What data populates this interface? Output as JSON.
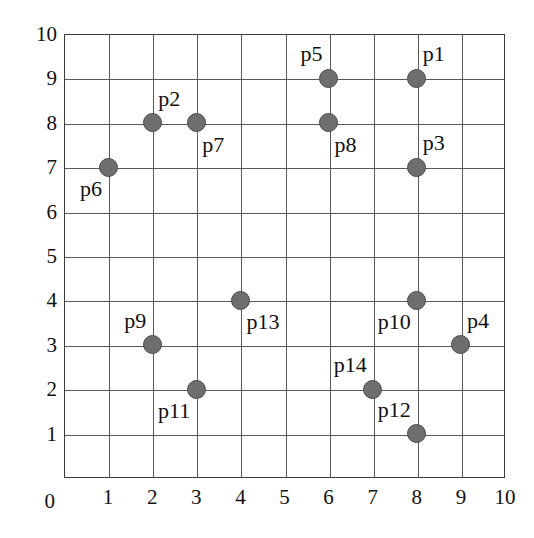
{
  "chart_data": {
    "type": "scatter",
    "title": "",
    "xlabel": "",
    "ylabel": "",
    "xlim": [
      0,
      10
    ],
    "ylim": [
      0,
      10
    ],
    "grid": true,
    "legend": "none",
    "marker": {
      "shape": "circle",
      "fill_color": "#6e6e6e",
      "edge_color": "#4a4a4a",
      "size_px": 19
    },
    "axis": {
      "frame_color": "#3c3c3c",
      "grid_color": "#5a5a5a",
      "x_ticks": [
        0,
        1,
        2,
        3,
        4,
        5,
        6,
        7,
        8,
        9,
        10
      ],
      "y_ticks": [
        0,
        1,
        2,
        3,
        4,
        5,
        6,
        7,
        8,
        9,
        10
      ],
      "x_tick_labels": [
        "0",
        "1",
        "2",
        "3",
        "4",
        "5",
        "6",
        "7",
        "8",
        "9",
        "10"
      ],
      "y_tick_labels": [
        "0",
        "1",
        "2",
        "3",
        "4",
        "5",
        "6",
        "7",
        "8",
        "9",
        "10"
      ]
    },
    "points": [
      {
        "label": "p1",
        "x": 8,
        "y": 9,
        "label_pos": "above-right"
      },
      {
        "label": "p2",
        "x": 2,
        "y": 8,
        "label_pos": "above-right"
      },
      {
        "label": "p3",
        "x": 8,
        "y": 7,
        "label_pos": "above-right"
      },
      {
        "label": "p4",
        "x": 9,
        "y": 3,
        "label_pos": "above-right"
      },
      {
        "label": "p5",
        "x": 6,
        "y": 9,
        "label_pos": "above-left"
      },
      {
        "label": "p6",
        "x": 1,
        "y": 7,
        "label_pos": "below-left"
      },
      {
        "label": "p7",
        "x": 3,
        "y": 8,
        "label_pos": "below-right"
      },
      {
        "label": "p8",
        "x": 6,
        "y": 8,
        "label_pos": "below-right"
      },
      {
        "label": "p9",
        "x": 2,
        "y": 3,
        "label_pos": "above-left"
      },
      {
        "label": "p10",
        "x": 8,
        "y": 4,
        "label_pos": "below-left"
      },
      {
        "label": "p11",
        "x": 3,
        "y": 2,
        "label_pos": "below-left"
      },
      {
        "label": "p12",
        "x": 8,
        "y": 1,
        "label_pos": "above-left"
      },
      {
        "label": "p13",
        "x": 4,
        "y": 4,
        "label_pos": "below-right"
      },
      {
        "label": "p14",
        "x": 7,
        "y": 2,
        "label_pos": "above-left"
      }
    ]
  },
  "geometry": {
    "plot_left": 64,
    "plot_top": 34,
    "plot_width": 441,
    "plot_height": 444,
    "y_tick_label_x": 57,
    "x_tick_label_y": 487,
    "origin_label_x": 45
  }
}
